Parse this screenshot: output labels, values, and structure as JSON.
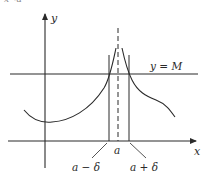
{
  "diagram": {
    "corner_text": "x→a",
    "axes": {
      "x_label": "x",
      "y_label": "y"
    },
    "horizontal_line_label": "y = M",
    "point_label": "a",
    "left_bound_label": "a − δ",
    "right_bound_label": "a + δ",
    "colors": {
      "line": "#2a2a2a",
      "background": "#ffffff"
    }
  }
}
